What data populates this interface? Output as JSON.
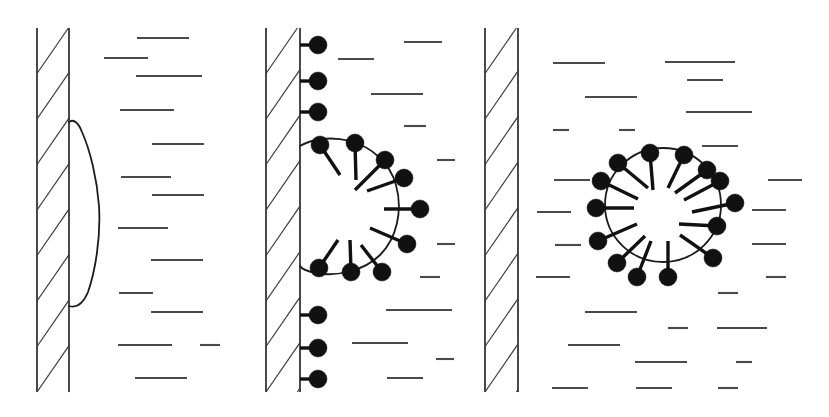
{
  "figure": {
    "panel_count": 3,
    "colors": {
      "wall_stroke": "#1c1c1c",
      "hatch_stroke": "#3a3a3a",
      "membrane_stroke": "#1c1c1c",
      "receptor_fill": "#111111",
      "ligand_dash": "#4a4a4a",
      "background": "#ffffff"
    },
    "canvas": {
      "width": 829,
      "height": 417
    }
  },
  "panels": [
    {
      "id": "panel-1",
      "label": "stage-1-bulge",
      "caption": "Membrane bulge forming at wall, no receptors",
      "wall": {
        "x_left": 37,
        "x_right": 69,
        "y_top": 28,
        "y_bottom": 392,
        "hatch_count": 8,
        "hatch_direction": "bottom-left-to-top-right"
      },
      "bud": {
        "type": "bulge",
        "attached": true,
        "receptor_count": 0,
        "outline": "M 69,122 C 74,118 79,124 82,132 C 90,150 97,178 99,206 C 101,238 95,272 88,292 C 83,304 76,308 69,306"
      },
      "ligand_dashes": [
        {
          "x": 137,
          "y": 38,
          "len": 52
        },
        {
          "x": 104,
          "y": 58,
          "len": 44
        },
        {
          "x": 136,
          "y": 76,
          "len": 66
        },
        {
          "x": 120,
          "y": 110,
          "len": 54
        },
        {
          "x": 152,
          "y": 144,
          "len": 52
        },
        {
          "x": 121,
          "y": 177,
          "len": 50
        },
        {
          "x": 152,
          "y": 195,
          "len": 52
        },
        {
          "x": 118,
          "y": 228,
          "len": 50
        },
        {
          "x": 151,
          "y": 260,
          "len": 52
        },
        {
          "x": 119,
          "y": 293,
          "len": 34
        },
        {
          "x": 151,
          "y": 312,
          "len": 52
        },
        {
          "x": 118,
          "y": 345,
          "len": 54
        },
        {
          "x": 200,
          "y": 345,
          "len": 20
        },
        {
          "x": 135,
          "y": 378,
          "len": 52
        }
      ]
    },
    {
      "id": "panel-2",
      "label": "stage-2-coated-bud",
      "caption": "Receptor-coated bud still attached to wall, neck not yet severed",
      "wall": {
        "x_left": 266,
        "x_right": 300,
        "y_top": 28,
        "y_bottom": 392,
        "hatch_count": 8,
        "hatch_direction": "bottom-left-to-top-right"
      },
      "bud": {
        "type": "coated-bud",
        "attached": true,
        "receptor_count": 15,
        "free_wall_receptors": 6,
        "bud_receptors": 9,
        "outline": "M 300,146 C 312,139 330,136 350,141 C 372,147 390,163 396,185 C 403,210 397,238 380,255 C 364,271 336,277 316,273 C 306,271 301,268 300,266"
      },
      "wall_receptors": [
        {
          "cx": 318,
          "cy": 45,
          "r": 9,
          "stem_x1": 300,
          "stem_y1": 45
        },
        {
          "cx": 318,
          "cy": 81,
          "r": 9,
          "stem_x1": 300,
          "stem_y1": 81
        },
        {
          "cx": 318,
          "cy": 112,
          "r": 9,
          "stem_x1": 300,
          "stem_y1": 112
        },
        {
          "cx": 318,
          "cy": 315,
          "r": 9,
          "stem_x1": 300,
          "stem_y1": 315
        },
        {
          "cx": 318,
          "cy": 348,
          "r": 9,
          "stem_x1": 300,
          "stem_y1": 348
        },
        {
          "cx": 318,
          "cy": 379,
          "r": 9,
          "stem_x1": 300,
          "stem_y1": 379
        }
      ],
      "bud_receptors": [
        {
          "cx": 320,
          "cy": 145,
          "r": 9,
          "spoke_x": 340,
          "spoke_y": 175
        },
        {
          "cx": 355,
          "cy": 143,
          "r": 9,
          "spoke_x": 356,
          "spoke_y": 180
        },
        {
          "cx": 385,
          "cy": 160,
          "r": 9,
          "spoke_x": 355,
          "spoke_y": 190
        },
        {
          "cx": 404,
          "cy": 178,
          "r": 9,
          "spoke_x": 367,
          "spoke_y": 191
        },
        {
          "cx": 420,
          "cy": 209,
          "r": 9,
          "spoke_x": 384,
          "spoke_y": 209
        },
        {
          "cx": 407,
          "cy": 244,
          "r": 9,
          "spoke_x": 370,
          "spoke_y": 228
        },
        {
          "cx": 382,
          "cy": 272,
          "r": 9,
          "spoke_x": 361,
          "spoke_y": 245
        },
        {
          "cx": 351,
          "cy": 272,
          "r": 9,
          "spoke_x": 350,
          "spoke_y": 240
        },
        {
          "cx": 319,
          "cy": 268,
          "r": 9,
          "spoke_x": 338,
          "spoke_y": 240
        }
      ],
      "ligand_dashes": [
        {
          "x": 404,
          "y": 42,
          "len": 38
        },
        {
          "x": 338,
          "y": 59,
          "len": 36
        },
        {
          "x": 371,
          "y": 94,
          "len": 52
        },
        {
          "x": 404,
          "y": 126,
          "len": 22
        },
        {
          "x": 437,
          "y": 160,
          "len": 18
        },
        {
          "x": 437,
          "y": 244,
          "len": 18
        },
        {
          "x": 420,
          "y": 277,
          "len": 20
        },
        {
          "x": 386,
          "y": 310,
          "len": 66
        },
        {
          "x": 352,
          "y": 343,
          "len": 56
        },
        {
          "x": 436,
          "y": 359,
          "len": 18
        },
        {
          "x": 387,
          "y": 378,
          "len": 36
        }
      ]
    },
    {
      "id": "panel-3",
      "label": "stage-3-free-vesicle",
      "caption": "Fully detached receptor-coated vesicle in cytoplasm",
      "wall": {
        "x_left": 485,
        "x_right": 518,
        "y_top": 28,
        "y_bottom": 392,
        "hatch_count": 8,
        "hatch_direction": "bottom-left-to-top-right"
      },
      "bud": {
        "type": "free-vesicle",
        "attached": false,
        "receptor_count": 14,
        "circle": {
          "cx": 663,
          "cy": 205,
          "rx": 58,
          "ry": 57
        }
      },
      "vesicle_receptors": [
        {
          "cx": 618,
          "cy": 163,
          "r": 9,
          "spoke_x": 648,
          "spoke_y": 188
        },
        {
          "cx": 650,
          "cy": 153,
          "r": 9,
          "spoke_x": 653,
          "spoke_y": 190
        },
        {
          "cx": 684,
          "cy": 155,
          "r": 9,
          "spoke_x": 668,
          "spoke_y": 188
        },
        {
          "cx": 707,
          "cy": 170,
          "r": 9,
          "spoke_x": 675,
          "spoke_y": 193
        },
        {
          "cx": 601,
          "cy": 181,
          "r": 9,
          "spoke_x": 638,
          "spoke_y": 199
        },
        {
          "cx": 720,
          "cy": 181,
          "r": 9,
          "spoke_x": 684,
          "spoke_y": 200
        },
        {
          "cx": 735,
          "cy": 203,
          "r": 9,
          "spoke_x": 692,
          "spoke_y": 212
        },
        {
          "cx": 596,
          "cy": 208,
          "r": 9,
          "spoke_x": 634,
          "spoke_y": 208
        },
        {
          "cx": 717,
          "cy": 226,
          "r": 9,
          "spoke_x": 679,
          "spoke_y": 224
        },
        {
          "cx": 598,
          "cy": 241,
          "r": 9,
          "spoke_x": 637,
          "spoke_y": 224
        },
        {
          "cx": 713,
          "cy": 258,
          "r": 9,
          "spoke_x": 680,
          "spoke_y": 235
        },
        {
          "cx": 617,
          "cy": 263,
          "r": 9,
          "spoke_x": 645,
          "spoke_y": 236
        },
        {
          "cx": 637,
          "cy": 277,
          "r": 9,
          "spoke_x": 651,
          "spoke_y": 241
        },
        {
          "cx": 668,
          "cy": 277,
          "r": 9,
          "spoke_x": 668,
          "spoke_y": 241
        }
      ],
      "ligand_dashes": [
        {
          "x": 553,
          "y": 63,
          "len": 52
        },
        {
          "x": 665,
          "y": 62,
          "len": 70
        },
        {
          "x": 687,
          "y": 80,
          "len": 36
        },
        {
          "x": 585,
          "y": 97,
          "len": 52
        },
        {
          "x": 686,
          "y": 112,
          "len": 66
        },
        {
          "x": 553,
          "y": 130,
          "len": 16
        },
        {
          "x": 619,
          "y": 130,
          "len": 16
        },
        {
          "x": 702,
          "y": 146,
          "len": 36
        },
        {
          "x": 554,
          "y": 180,
          "len": 36
        },
        {
          "x": 768,
          "y": 180,
          "len": 34
        },
        {
          "x": 537,
          "y": 212,
          "len": 34
        },
        {
          "x": 752,
          "y": 210,
          "len": 34
        },
        {
          "x": 555,
          "y": 245,
          "len": 26
        },
        {
          "x": 752,
          "y": 244,
          "len": 34
        },
        {
          "x": 536,
          "y": 277,
          "len": 34
        },
        {
          "x": 766,
          "y": 277,
          "len": 20
        },
        {
          "x": 718,
          "y": 293,
          "len": 20
        },
        {
          "x": 585,
          "y": 312,
          "len": 52
        },
        {
          "x": 668,
          "y": 328,
          "len": 20
        },
        {
          "x": 717,
          "y": 328,
          "len": 50
        },
        {
          "x": 568,
          "y": 345,
          "len": 52
        },
        {
          "x": 635,
          "y": 362,
          "len": 52
        },
        {
          "x": 736,
          "y": 362,
          "len": 16
        },
        {
          "x": 552,
          "y": 388,
          "len": 36
        },
        {
          "x": 636,
          "y": 388,
          "len": 36
        },
        {
          "x": 718,
          "y": 388,
          "len": 20
        }
      ]
    }
  ]
}
